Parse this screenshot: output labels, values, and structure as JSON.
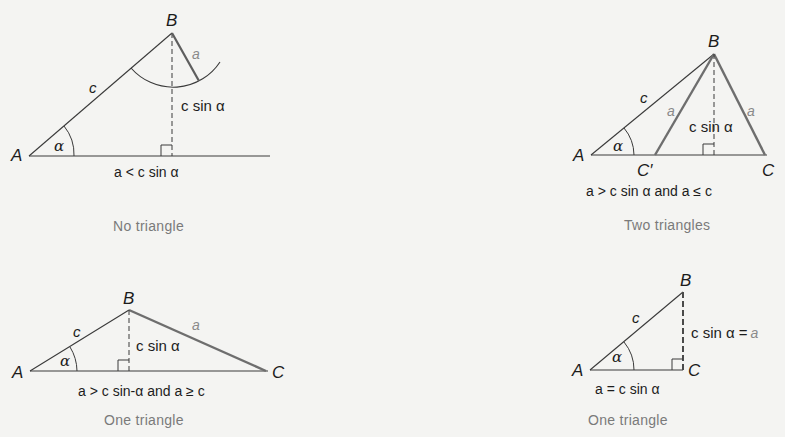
{
  "colors": {
    "background": "#f4f4f2",
    "thin_line": "#3a3a3a",
    "thick_side_a": "#6e6e6e",
    "caption_text": "#7a7a7a",
    "side_a_label": "#8a8a8a"
  },
  "diagrams": [
    {
      "id": "no-triangle",
      "vertices": {
        "A": "A",
        "B": "B"
      },
      "sides": {
        "c": "c",
        "a": "a"
      },
      "angle": "α",
      "height_label": "c sin α",
      "condition": "a < c sin α",
      "caption": "No triangle"
    },
    {
      "id": "two-triangles",
      "vertices": {
        "A": "A",
        "B": "B",
        "C_prime": "C′",
        "C": "C"
      },
      "sides": {
        "c": "c",
        "a_left": "a",
        "a_right": "a"
      },
      "angle": "α",
      "height_label": "c sin α",
      "condition": "a > c sin α and a ≤ c",
      "caption": "Two triangles"
    },
    {
      "id": "one-triangle-obtuse",
      "vertices": {
        "A": "A",
        "B": "B",
        "C": "C"
      },
      "sides": {
        "c": "c",
        "a": "a"
      },
      "angle": "α",
      "height_label": "c sin α",
      "condition": "a > c sin-α and a ≥ c",
      "caption": "One triangle"
    },
    {
      "id": "one-triangle-right",
      "vertices": {
        "A": "A",
        "B": "B",
        "C": "C"
      },
      "sides": {
        "c": "c",
        "a": "a"
      },
      "angle": "α",
      "height_label": "c sin α =",
      "height_label_a": "a",
      "condition": "a = c sin α",
      "caption": "One triangle"
    }
  ]
}
